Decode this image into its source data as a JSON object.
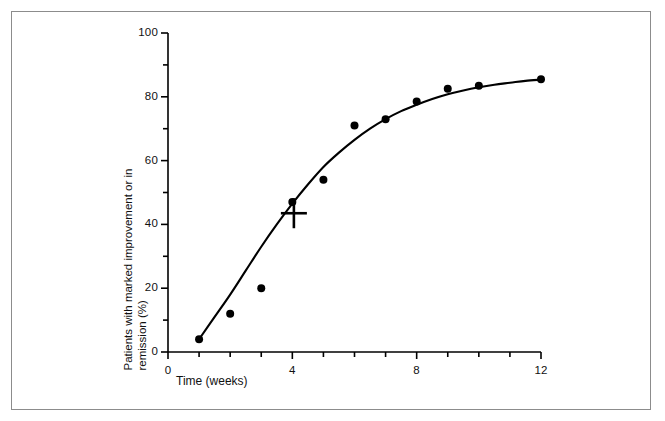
{
  "figure": {
    "has_outer_frame": true,
    "background_color": "#ffffff",
    "ink_color": "#000000",
    "frame_color": "#8c8c8c"
  },
  "chart_data": {
    "type": "scatter",
    "title": "",
    "xlabel": "Time (weeks)",
    "ylabel": "Patients with marked improvement or in remission (%)",
    "ylabel_line1": "Patients with marked improvement or in",
    "ylabel_line2": "remission (%)",
    "xlim": [
      0,
      12
    ],
    "ylim": [
      0,
      100
    ],
    "xticks": [
      0,
      1,
      2,
      3,
      4,
      5,
      6,
      7,
      8,
      9,
      10,
      11,
      12
    ],
    "xtick_labels": [
      "0",
      "",
      "",
      "",
      "4",
      "",
      "",
      "",
      "8",
      "",
      "",
      "",
      "12"
    ],
    "yticks": [
      0,
      10,
      20,
      30,
      40,
      50,
      60,
      70,
      80,
      90,
      100
    ],
    "ytick_labels": [
      "0",
      "",
      "20",
      "",
      "40",
      "",
      "60",
      "",
      "80",
      "",
      "100"
    ],
    "grid": false,
    "legend": "none",
    "x": [
      1,
      2,
      3,
      4,
      5,
      6,
      7,
      8,
      9,
      10,
      12
    ],
    "values": [
      4,
      12,
      20,
      47,
      54,
      71,
      73,
      78.5,
      82.5,
      83.5,
      85.5
    ],
    "marker": "filled-circle",
    "marker_size_px": 8,
    "series": [
      {
        "name": "Observed proportion",
        "marker": "filled-circle",
        "points": [
          {
            "x": 1,
            "y": 4
          },
          {
            "x": 2,
            "y": 12
          },
          {
            "x": 3,
            "y": 20
          },
          {
            "x": 4,
            "y": 47
          },
          {
            "x": 5,
            "y": 54
          },
          {
            "x": 6,
            "y": 71
          },
          {
            "x": 7,
            "y": 73
          },
          {
            "x": 8,
            "y": 78.5
          },
          {
            "x": 9,
            "y": 82.5
          },
          {
            "x": 10,
            "y": 83.5
          },
          {
            "x": 12,
            "y": 85.5
          }
        ]
      },
      {
        "name": "Fitted curve",
        "marker": "none",
        "style": "solid-line",
        "points": [
          {
            "x": 1,
            "y": 4
          },
          {
            "x": 1.5,
            "y": 11
          },
          {
            "x": 2,
            "y": 18
          },
          {
            "x": 2.5,
            "y": 25.5
          },
          {
            "x": 3,
            "y": 33
          },
          {
            "x": 3.5,
            "y": 40
          },
          {
            "x": 4,
            "y": 46.5
          },
          {
            "x": 4.5,
            "y": 52.5
          },
          {
            "x": 5,
            "y": 58
          },
          {
            "x": 5.5,
            "y": 62.5
          },
          {
            "x": 6,
            "y": 66.5
          },
          {
            "x": 6.5,
            "y": 70
          },
          {
            "x": 7,
            "y": 73
          },
          {
            "x": 7.5,
            "y": 75.5
          },
          {
            "x": 8,
            "y": 77.5
          },
          {
            "x": 8.5,
            "y": 79.3
          },
          {
            "x": 9,
            "y": 80.8
          },
          {
            "x": 9.5,
            "y": 82
          },
          {
            "x": 10,
            "y": 83
          },
          {
            "x": 10.5,
            "y": 83.8
          },
          {
            "x": 11,
            "y": 84.4
          },
          {
            "x": 11.5,
            "y": 85
          },
          {
            "x": 12,
            "y": 85.4
          }
        ]
      },
      {
        "name": "Cross annotation marker",
        "marker": "plus-cross",
        "points": [
          {
            "x": 4.05,
            "y": 43.5
          }
        ]
      }
    ]
  }
}
